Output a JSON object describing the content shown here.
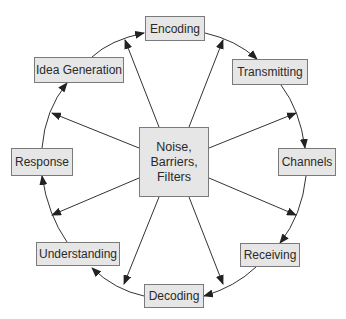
{
  "diagram": {
    "type": "circular process with central hub",
    "center": {
      "lines": [
        "Noise,",
        "Barriers,",
        "Filters"
      ]
    },
    "steps": [
      {
        "id": "encoding",
        "label": "Encoding"
      },
      {
        "id": "transmitting",
        "label": "Transmitting"
      },
      {
        "id": "channels",
        "label": "Channels"
      },
      {
        "id": "receiving",
        "label": "Receiving"
      },
      {
        "id": "decoding",
        "label": "Decoding"
      },
      {
        "id": "understanding",
        "label": "Understanding"
      },
      {
        "id": "response",
        "label": "Response"
      },
      {
        "id": "idea_generation",
        "label": "Idea Generation"
      }
    ],
    "colors": {
      "box_fill": "#e6e6e6",
      "box_border": "#7a7a7a",
      "line": "#333333",
      "text": "#2a2a2a"
    }
  }
}
